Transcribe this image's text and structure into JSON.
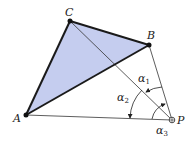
{
  "diagram": {
    "fill_color": "#c5cdef",
    "edge_color": "#1a1a1a",
    "points": {
      "A": {
        "label": "A"
      },
      "B": {
        "label": "B"
      },
      "C": {
        "label": "C"
      },
      "P": {
        "label": "P"
      }
    },
    "angles": {
      "a1": {
        "symbol": "α",
        "sub": "1"
      },
      "a2": {
        "symbol": "α",
        "sub": "2"
      },
      "a3": {
        "symbol": "α",
        "sub": "3"
      }
    }
  }
}
